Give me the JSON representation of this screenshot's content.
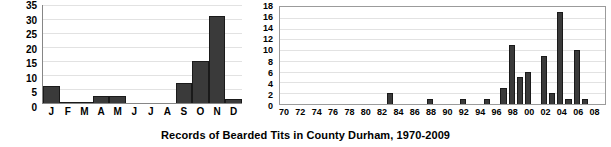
{
  "caption": "Records of Bearded Tits in County Durham, 1970-2009",
  "chart_data": [
    {
      "id": "monthly",
      "type": "bar",
      "title": "",
      "xlabel": "",
      "ylabel": "",
      "ylim": [
        0,
        35
      ],
      "yticks": [
        0,
        5,
        10,
        15,
        20,
        25,
        30,
        35
      ],
      "grid": true,
      "legend": "none",
      "categories": [
        "J",
        "F",
        "M",
        "A",
        "M",
        "J",
        "J",
        "A",
        "S",
        "O",
        "N",
        "D"
      ],
      "values": [
        6,
        0.4,
        0.4,
        2.5,
        2.5,
        0,
        0,
        0,
        7,
        15,
        31,
        1.5
      ]
    },
    {
      "id": "yearly",
      "type": "bar",
      "title": "",
      "xlabel": "",
      "ylabel": "",
      "ylim": [
        0,
        18
      ],
      "yticks": [
        0,
        2,
        4,
        6,
        8,
        10,
        12,
        14,
        16,
        18
      ],
      "grid": true,
      "legend": "none",
      "categories": [
        "70",
        "71",
        "72",
        "73",
        "74",
        "75",
        "76",
        "77",
        "78",
        "79",
        "80",
        "81",
        "82",
        "83",
        "84",
        "85",
        "86",
        "87",
        "88",
        "89",
        "90",
        "91",
        "92",
        "93",
        "94",
        "95",
        "96",
        "97",
        "98",
        "99",
        "00",
        "01",
        "02",
        "03",
        "04",
        "05",
        "06",
        "07",
        "08",
        "09"
      ],
      "xticklabels": [
        "70",
        "72",
        "74",
        "76",
        "78",
        "80",
        "82",
        "84",
        "86",
        "88",
        "90",
        "92",
        "94",
        "96",
        "98",
        "00",
        "02",
        "04",
        "06",
        "08"
      ],
      "values": [
        0,
        0,
        0,
        0,
        0,
        0,
        0,
        0,
        0,
        0,
        0,
        0,
        0,
        2,
        0,
        0,
        0,
        0,
        1,
        0,
        0,
        0,
        1,
        0,
        0,
        1,
        0,
        3,
        11,
        5,
        6,
        0,
        9,
        2,
        17,
        1,
        10,
        1,
        0,
        0
      ]
    }
  ]
}
